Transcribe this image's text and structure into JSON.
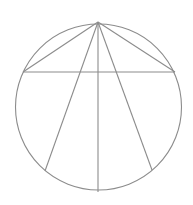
{
  "diagram": {
    "type": "geometry",
    "stroke_color": "#8c8c8c",
    "background": "#ffffff",
    "circle": {
      "cx": 98.5,
      "cy": 107,
      "r": 83
    },
    "apex": {
      "x": 98,
      "y": 22
    },
    "points": {
      "A": {
        "x": 98,
        "y": 22
      },
      "B": {
        "x": 23,
        "y": 72
      },
      "C": {
        "x": 175,
        "y": 72
      },
      "D": {
        "x": 45,
        "y": 171
      },
      "E": {
        "x": 98,
        "y": 192
      },
      "F": {
        "x": 152,
        "y": 170
      }
    },
    "segments": [
      {
        "name": "chord-apex-left",
        "from": "A",
        "to": "B"
      },
      {
        "name": "chord-apex-right",
        "from": "A",
        "to": "C"
      },
      {
        "name": "chord-horizontal",
        "from": "B",
        "to": "C"
      },
      {
        "name": "chord-apex-lower-left",
        "from": "A",
        "to": "D"
      },
      {
        "name": "diameter-vertical",
        "from": "A",
        "to": "E"
      },
      {
        "name": "chord-apex-lower-right",
        "from": "A",
        "to": "F"
      }
    ]
  }
}
